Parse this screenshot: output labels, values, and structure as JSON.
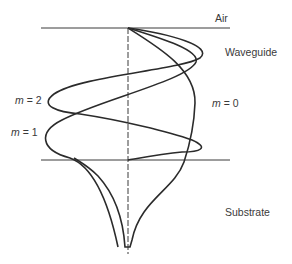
{
  "diagram": {
    "regions": {
      "air": "Air",
      "waveguide": "Waveguide",
      "substrate": "Substrate"
    },
    "modes": [
      {
        "m_symbol": "m",
        "eq": " = 0"
      },
      {
        "m_symbol": "m",
        "eq": " = 1"
      },
      {
        "m_symbol": "m",
        "eq": " = 2"
      }
    ],
    "colors": {
      "line": "#2b2b2b",
      "text": "#3a3a3a",
      "background": "#ffffff"
    }
  }
}
